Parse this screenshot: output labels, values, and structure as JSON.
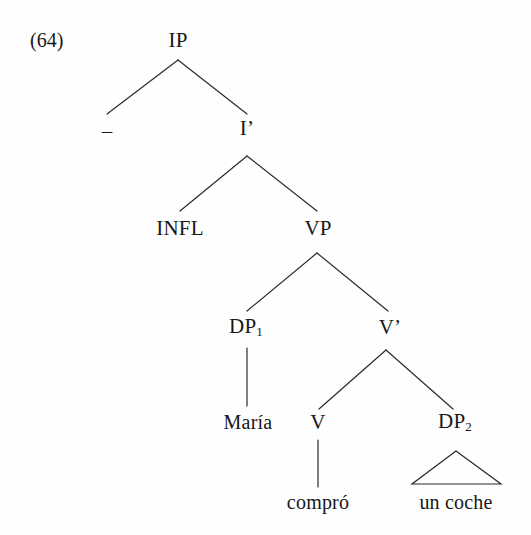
{
  "figure": {
    "example_number": "(64)",
    "type": "syntax-tree",
    "language": "Spanish",
    "sentence": "María compró un coche"
  },
  "tree": {
    "nodes": [
      {
        "id": "ip",
        "label": "IP",
        "x": 178,
        "y": 40,
        "kind": "phrase"
      },
      {
        "id": "spec",
        "label": "–",
        "x": 107,
        "y": 131,
        "kind": "empty"
      },
      {
        "id": "ibar",
        "label": "I’",
        "x": 247,
        "y": 128,
        "kind": "bar"
      },
      {
        "id": "infl",
        "label": "INFL",
        "x": 180,
        "y": 228,
        "kind": "head"
      },
      {
        "id": "vp",
        "label": "VP",
        "x": 318,
        "y": 228,
        "kind": "phrase"
      },
      {
        "id": "dp1",
        "label": "DP",
        "sub": "1",
        "x": 246,
        "y": 327,
        "kind": "phrase"
      },
      {
        "id": "vbar",
        "label": "V’",
        "x": 390,
        "y": 327,
        "kind": "bar"
      },
      {
        "id": "maria",
        "label": "María",
        "x": 248,
        "y": 422,
        "kind": "leaf"
      },
      {
        "id": "v",
        "label": "V",
        "x": 318,
        "y": 422,
        "kind": "head"
      },
      {
        "id": "dp2",
        "label": "DP",
        "sub": "2",
        "x": 455,
        "y": 422,
        "kind": "phrase"
      },
      {
        "id": "compro",
        "label": "compró",
        "x": 318,
        "y": 502,
        "kind": "leaf"
      },
      {
        "id": "uncoche",
        "label": "un coche",
        "x": 456,
        "y": 502,
        "kind": "leaf"
      }
    ],
    "edges": [
      {
        "from": "ip",
        "to": "spec",
        "x1": 178,
        "y1": 60,
        "x2": 107,
        "y2": 114
      },
      {
        "from": "ip",
        "to": "ibar",
        "x1": 178,
        "y1": 60,
        "x2": 247,
        "y2": 114
      },
      {
        "from": "ibar",
        "to": "infl",
        "x1": 247,
        "y1": 156,
        "x2": 180,
        "y2": 211
      },
      {
        "from": "ibar",
        "to": "vp",
        "x1": 247,
        "y1": 156,
        "x2": 317,
        "y2": 211
      },
      {
        "from": "vp",
        "to": "dp1",
        "x1": 317,
        "y1": 253,
        "x2": 247,
        "y2": 311
      },
      {
        "from": "vp",
        "to": "vbar",
        "x1": 317,
        "y1": 253,
        "x2": 388,
        "y2": 311
      },
      {
        "from": "dp1",
        "to": "maria",
        "x1": 247,
        "y1": 348,
        "x2": 247,
        "y2": 406
      },
      {
        "from": "vbar",
        "to": "v",
        "x1": 386,
        "y1": 350,
        "x2": 319,
        "y2": 409
      },
      {
        "from": "vbar",
        "to": "dp2",
        "x1": 386,
        "y1": 350,
        "x2": 453,
        "y2": 409
      },
      {
        "from": "v",
        "to": "compro",
        "x1": 318,
        "y1": 440,
        "x2": 318,
        "y2": 487
      }
    ],
    "triangles": [
      {
        "under": "dp2",
        "apex_x": 456,
        "apex_y": 451,
        "left_x": 412,
        "left_y": 484,
        "right_x": 501,
        "right_y": 484
      }
    ],
    "line_color": "#2b2b2b",
    "line_width": 1.2
  }
}
